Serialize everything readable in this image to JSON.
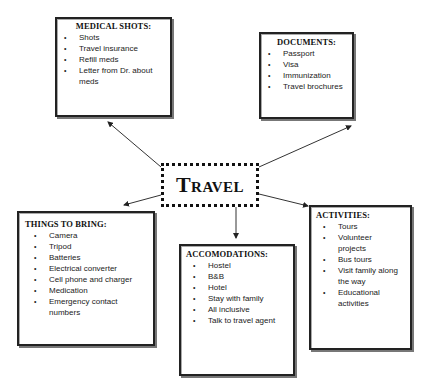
{
  "title": "Travel",
  "boxes": {
    "medical": {
      "heading": "MEDICAL SHOTS:",
      "items": [
        "Shots",
        "Travel insurance",
        "Refill meds",
        "Letter from Dr. about meds"
      ]
    },
    "documents": {
      "heading": "DOCUMENTS:",
      "items": [
        "Passport",
        "Visa",
        "Immunization",
        "Travel brochures"
      ]
    },
    "things": {
      "heading": "THINGS TO BRING:",
      "items": [
        "Camera",
        "Tripod",
        "Batteries",
        "Electrical converter",
        "Cell phone and charger",
        "Medication",
        "Emergency contact numbers"
      ]
    },
    "accommodations": {
      "heading": "ACCOMODATIONS:",
      "items": [
        "Hostel",
        "B&B",
        "Hotel",
        "Stay with family",
        "All inclusive",
        "Talk to travel agent"
      ]
    },
    "activities": {
      "heading": "ACTIVITIES:",
      "items": [
        "Tours",
        "Volunteer projects",
        "Bus tours",
        "Visit family along the way",
        "Educational activities"
      ]
    }
  }
}
